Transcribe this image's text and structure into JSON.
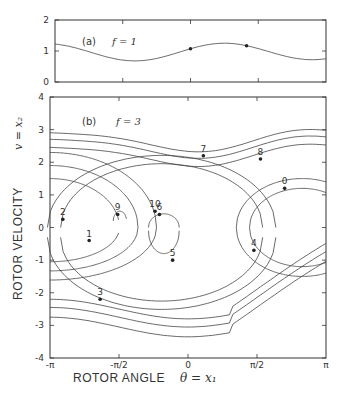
{
  "chart_data": [
    {
      "type": "line",
      "panel": "(a)",
      "param_label": "f = 1",
      "xlabel": "",
      "ylabel": "",
      "xlim": [
        -3.14159,
        3.14159
      ],
      "ylim": [
        0,
        2
      ],
      "yticks": [
        "0",
        "1",
        "2"
      ],
      "series": [
        {
          "name": "trajectory",
          "x": [
            -3.14,
            -2.5,
            -2.0,
            -1.5,
            -1.0,
            -0.5,
            0.0,
            0.5,
            1.0,
            1.3,
            1.6,
            2.0,
            2.5,
            3.14
          ],
          "y": [
            1.25,
            1.0,
            0.72,
            0.78,
            1.05,
            1.22,
            1.2,
            1.02,
            0.78,
            0.67,
            0.68,
            0.9,
            1.12,
            1.15
          ]
        }
      ],
      "markers": [
        {
          "x": 0.0,
          "y": 1.2
        },
        {
          "x": 1.3,
          "y": 0.67
        }
      ]
    },
    {
      "type": "line",
      "panel": "(b)",
      "param_label": "f = 3",
      "xlabel": "ROTOR ANGLE",
      "xlabel_math": "θ = x₁",
      "ylabel": "ROTOR VELOCITY",
      "ylabel_math": "v = x₂",
      "xlim": [
        -3.14159,
        3.14159
      ],
      "ylim": [
        -4,
        4
      ],
      "xticks": [
        "-π",
        "-π/2",
        "0",
        "π/2",
        "π"
      ],
      "yticks": [
        "-4",
        "-3",
        "-2",
        "-1",
        "0",
        "1",
        "2",
        "3",
        "4"
      ],
      "numbered_points": [
        {
          "label": "0",
          "x": 2.2,
          "y": 1.2
        },
        {
          "label": "1",
          "x": -2.25,
          "y": -0.4
        },
        {
          "label": "2",
          "x": -2.85,
          "y": 0.25
        },
        {
          "label": "3",
          "x": -2.0,
          "y": -2.2
        },
        {
          "label": "4",
          "x": 1.5,
          "y": -0.7
        },
        {
          "label": "5",
          "x": -0.35,
          "y": -1.0
        },
        {
          "label": "6",
          "x": -0.65,
          "y": 0.4
        },
        {
          "label": "7",
          "x": 0.35,
          "y": 2.2
        },
        {
          "label": "8",
          "x": 1.65,
          "y": 2.1
        },
        {
          "label": "9",
          "x": -1.6,
          "y": 0.4
        },
        {
          "label": "10",
          "x": -0.75,
          "y": 0.5
        }
      ]
    }
  ]
}
